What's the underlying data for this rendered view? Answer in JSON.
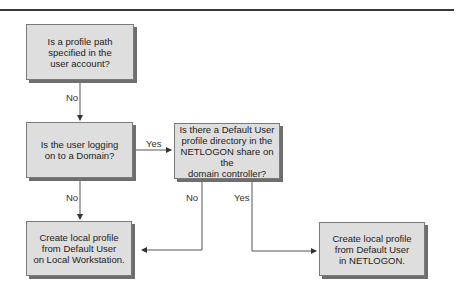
{
  "diagram": {
    "type": "flowchart",
    "nodes": [
      {
        "id": "q1",
        "text": "Is a profile path\nspecified in the\nuser account?"
      },
      {
        "id": "q2",
        "text": "Is the user logging\non to a Domain?"
      },
      {
        "id": "q3",
        "text": "Is there a Default User\nprofile directory in the\nNETLOGON share on the\ndomain controller?"
      },
      {
        "id": "r1",
        "text": "Create local profile\nfrom Default User\non Local Workstation."
      },
      {
        "id": "r2",
        "text": "Create local profile\nfrom Default User\nin NETLOGON."
      }
    ],
    "edges": [
      {
        "from": "q1",
        "to": "q2",
        "label": "No"
      },
      {
        "from": "q2",
        "to": "q3",
        "label": "Yes"
      },
      {
        "from": "q2",
        "to": "r1",
        "label": "No"
      },
      {
        "from": "q3",
        "to": "r1",
        "label": "No"
      },
      {
        "from": "q3",
        "to": "r2",
        "label": "Yes"
      }
    ]
  }
}
